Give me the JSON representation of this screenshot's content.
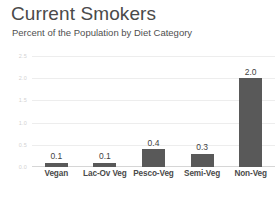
{
  "chart_data": {
    "type": "bar",
    "title": "Current Smokers",
    "subtitle": "Percent of the Population by Diet Category",
    "categories": [
      "Vegan",
      "Lac-Ov Veg",
      "Pesco-Veg",
      "Semi-Veg",
      "Non-Veg"
    ],
    "values": [
      0.1,
      0.1,
      0.4,
      0.3,
      2.0
    ],
    "value_labels": [
      "0.1",
      "0.1",
      "0.4",
      "0.3",
      "2.0"
    ],
    "xlabel": "",
    "ylabel": "",
    "ylim": [
      0.0,
      2.5
    ],
    "ytick_labels": [
      "2.5",
      "2.0",
      "1.5",
      "1.0",
      "0.5",
      "0.0"
    ],
    "ytick_values": [
      2.5,
      2.0,
      1.5,
      1.0,
      0.5,
      0.0
    ],
    "grid": true,
    "legend": false,
    "bar_color": "#595959",
    "gridline_color": "#ededed",
    "axis_color": "#d6d6d6"
  }
}
